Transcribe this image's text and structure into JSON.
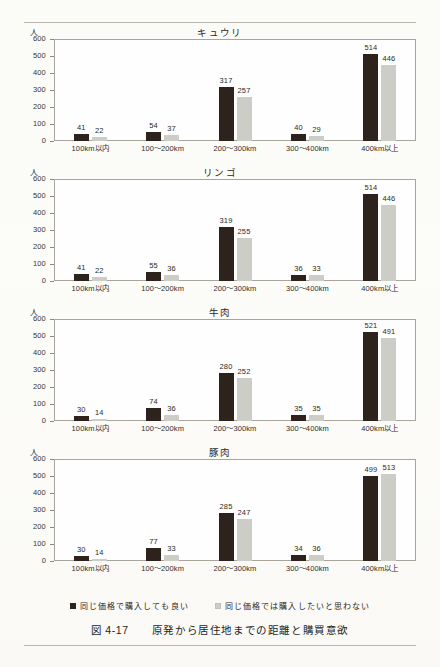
{
  "figure": {
    "label": "図 4-17",
    "caption": "原発から居住地までの距離と購買意欲",
    "unit": "人"
  },
  "legend": {
    "items": [
      {
        "label": "同じ価格で購入しても良い",
        "color": "#2e221c",
        "key": "willing"
      },
      {
        "label": "同じ価格では購入したいと思わない",
        "color": "#cdcdc8",
        "key": "unwilling"
      }
    ]
  },
  "axis": {
    "y_ticks": [
      "600",
      "500",
      "400",
      "300",
      "200",
      "100",
      "0"
    ],
    "x_labels": [
      "100km以内",
      "100〜200km",
      "200〜300km",
      "300〜400km",
      "400km以上"
    ]
  },
  "chart_data": [
    {
      "type": "bar",
      "title": "キュウリ",
      "categories": [
        "100km以内",
        "100〜200km",
        "200〜300km",
        "300〜400km",
        "400km以上"
      ],
      "series": [
        {
          "name": "同じ価格で購入しても良い",
          "values": [
            41,
            54,
            317,
            40,
            514
          ]
        },
        {
          "name": "同じ価格では購入したいと思わない",
          "values": [
            22,
            37,
            257,
            29,
            446
          ]
        }
      ],
      "xlabel": "",
      "ylabel": "人",
      "ylim": [
        0,
        600
      ],
      "ytick_step": 100,
      "grid": false,
      "legend_position": "bottom"
    },
    {
      "type": "bar",
      "title": "リンゴ",
      "categories": [
        "100km以内",
        "100〜200km",
        "200〜300km",
        "300〜400km",
        "400km以上"
      ],
      "series": [
        {
          "name": "同じ価格で購入しても良い",
          "values": [
            41,
            55,
            319,
            36,
            514
          ]
        },
        {
          "name": "同じ価格では購入したいと思わない",
          "values": [
            22,
            36,
            255,
            33,
            446
          ]
        }
      ],
      "xlabel": "",
      "ylabel": "人",
      "ylim": [
        0,
        600
      ],
      "ytick_step": 100,
      "grid": false,
      "legend_position": "bottom"
    },
    {
      "type": "bar",
      "title": "牛肉",
      "categories": [
        "100km以内",
        "100〜200km",
        "200〜300km",
        "300〜400km",
        "400km以上"
      ],
      "series": [
        {
          "name": "同じ価格で購入しても良い",
          "values": [
            30,
            74,
            280,
            35,
            521
          ]
        },
        {
          "name": "同じ価格では購入したいと思わない",
          "values": [
            14,
            36,
            252,
            35,
            491
          ]
        }
      ],
      "xlabel": "",
      "ylabel": "人",
      "ylim": [
        0,
        600
      ],
      "ytick_step": 100,
      "grid": false,
      "legend_position": "bottom"
    },
    {
      "type": "bar",
      "title": "豚肉",
      "categories": [
        "100km以内",
        "100〜200km",
        "200〜300km",
        "300〜400km",
        "400km以上"
      ],
      "series": [
        {
          "name": "同じ価格で購入しても良い",
          "values": [
            30,
            77,
            285,
            34,
            499
          ]
        },
        {
          "name": "同じ価格では購入したいと思わない",
          "values": [
            14,
            33,
            247,
            36,
            513
          ]
        }
      ],
      "xlabel": "",
      "ylabel": "人",
      "ylim": [
        0,
        600
      ],
      "ytick_step": 100,
      "grid": false,
      "legend_position": "bottom"
    }
  ]
}
